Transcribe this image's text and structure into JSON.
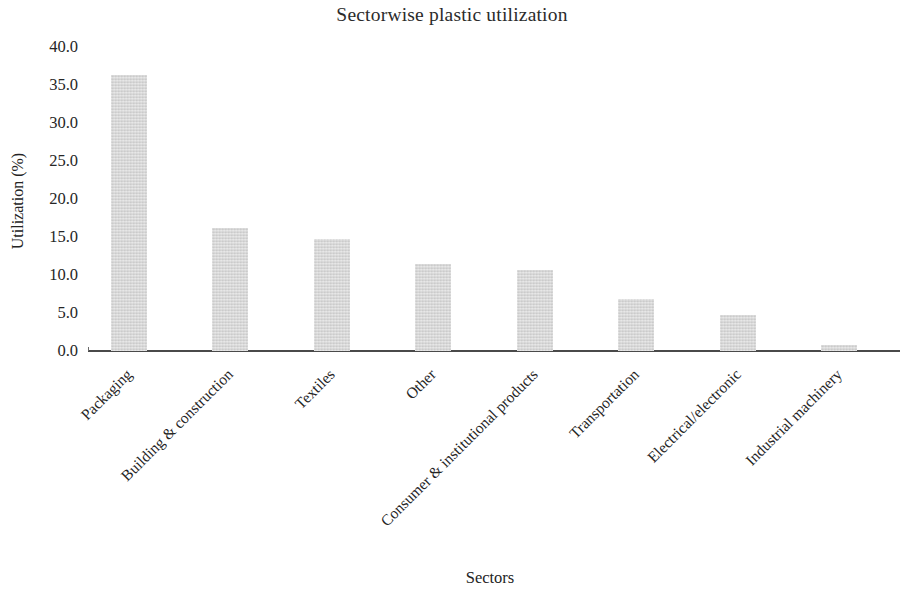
{
  "chart_data": {
    "type": "bar",
    "title": "Sectorwise plastic utilization",
    "xlabel": "Sectors",
    "ylabel": "Utilization (%)",
    "categories": [
      "Packaging",
      "Building & construction",
      "Textiles",
      "Other",
      "Consumer & institutional products",
      "Transportation",
      "Electrical/electronic",
      "Industrial machinery"
    ],
    "values": [
      36.3,
      16.2,
      14.7,
      11.4,
      10.7,
      6.8,
      4.7,
      0.8
    ],
    "ylim": [
      0.0,
      40.0
    ],
    "ytick_step": 5.0,
    "ytick_labels": [
      "0.0",
      "5.0",
      "10.0",
      "15.0",
      "20.0",
      "25.0",
      "30.0",
      "35.0",
      "40.0"
    ],
    "grid": false,
    "legend": false,
    "bar_color": "#d7d7d7",
    "axis_color": "#4a4a4a",
    "text_color": "#242424",
    "xtick_rotation_deg": -45
  }
}
